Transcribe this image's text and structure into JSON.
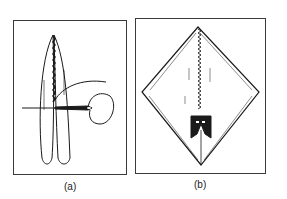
{
  "figure": {
    "panels": [
      {
        "id": "a",
        "label": "(a)",
        "description": "Folded strip stitched with needle and thread"
      },
      {
        "id": "b",
        "label": "(b)",
        "description": "Diamond-shaped folded sheet with stitched center seam and clip"
      }
    ]
  },
  "colors": {
    "ink": "#1a1a1a",
    "frame": "#3a3a3a",
    "background": "#ffffff"
  }
}
